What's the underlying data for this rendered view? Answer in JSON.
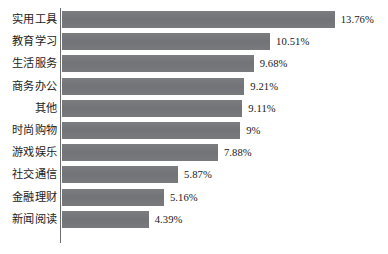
{
  "chart_data": {
    "type": "bar",
    "orientation": "horizontal",
    "title": "",
    "subtitle": "",
    "xlabel": "",
    "ylabel": "",
    "grid": false,
    "legend": false,
    "axis": {
      "category_axis": "vertical-left",
      "value_axis_visible": false,
      "value_tick_labels": [],
      "xlim": [
        0,
        13.76
      ],
      "units": "percent"
    },
    "colors": {
      "bar": "#76777a",
      "axis_line": "#6d6e70",
      "text": "#1c1c1c",
      "background": "#ffffff"
    },
    "categories": [
      "实用工具",
      "教育学习",
      "生活服务",
      "商务办公",
      "其他",
      "时尚购物",
      "游戏娱乐",
      "社交通信",
      "金融理财",
      "新闻阅读"
    ],
    "values": [
      13.76,
      10.51,
      9.68,
      9.21,
      9.11,
      9,
      7.88,
      5.87,
      5.16,
      4.39
    ],
    "data_labels": [
      "13.76%",
      "10.51%",
      "9.68%",
      "9.21%",
      "9.11%",
      "9%",
      "7.88%",
      "5.87%",
      "5.16%",
      "4.39%"
    ],
    "bars": [
      {
        "category": "实用工具",
        "value": 13.76,
        "label": "13.76%"
      },
      {
        "category": "教育学习",
        "value": 10.51,
        "label": "10.51%"
      },
      {
        "category": "生活服务",
        "value": 9.68,
        "label": "9.68%"
      },
      {
        "category": "商务办公",
        "value": 9.21,
        "label": "9.21%"
      },
      {
        "category": "其他",
        "value": 9.11,
        "label": "9.11%"
      },
      {
        "category": "时尚购物",
        "value": 9,
        "label": "9%"
      },
      {
        "category": "游戏娱乐",
        "value": 7.88,
        "label": "7.88%"
      },
      {
        "category": "社交通信",
        "value": 5.87,
        "label": "5.87%"
      },
      {
        "category": "金融理财",
        "value": 5.16,
        "label": "5.16%"
      },
      {
        "category": "新闻阅读",
        "value": 4.39,
        "label": "4.39%"
      }
    ]
  },
  "layout": {
    "axis_x": 61.5,
    "first_bar_top": 11,
    "row_pitch": 22.2,
    "bar_height": 17,
    "px_per_percent": 19.85,
    "value_label_gap": 6
  }
}
